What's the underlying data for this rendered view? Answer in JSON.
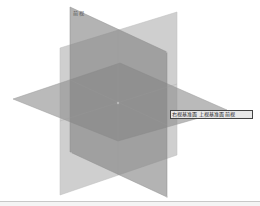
{
  "viewport": {
    "background": "#ffffff"
  },
  "planes": {
    "right_plane": {
      "name": "Right Plane",
      "fill": "#a0a0a0",
      "opacity": 0.55
    },
    "top_plane": {
      "name": "Top Plane",
      "fill": "#8a8a8a",
      "opacity": 0.6
    },
    "front_plane": {
      "name": "Front Plane",
      "fill": "#7a7a7a",
      "opacity": 0.6
    }
  },
  "labels": {
    "front_plane_label": "前视",
    "tooltip": "右视基准面 上视基准面 前视"
  },
  "origin": {
    "marker": "origin-point"
  }
}
